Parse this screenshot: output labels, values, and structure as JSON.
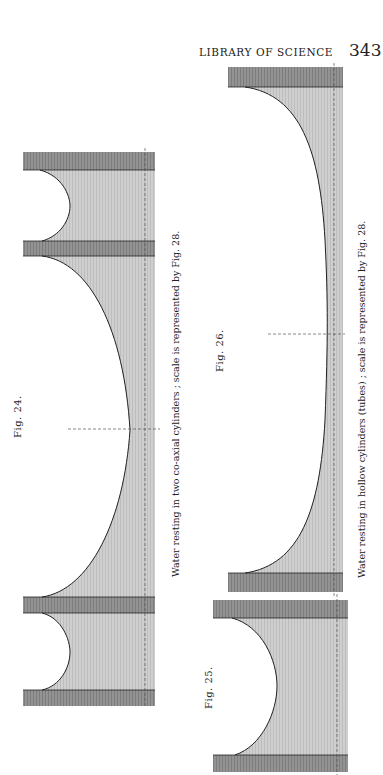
{
  "page": {
    "running_header": "LIBRARY OF SCIENCE",
    "page_number": "343"
  },
  "figures": [
    {
      "id": "fig-24",
      "label": "Fig. 24.",
      "caption": "Water resting in two co-axial cylinders ; scale is represented by Fig. 28."
    },
    {
      "id": "fig-25",
      "label": "Fig. 25.",
      "caption": ""
    },
    {
      "id": "fig-26",
      "label": "Fig. 26.",
      "caption": "Water resting in hollow cylinders (tubes) ; scale is represented by Fig. 28."
    }
  ],
  "colors": {
    "wall": "#8f8f8f",
    "water": "#cfcfcf",
    "outline": "#222222",
    "dashed_axis": "#555555"
  }
}
